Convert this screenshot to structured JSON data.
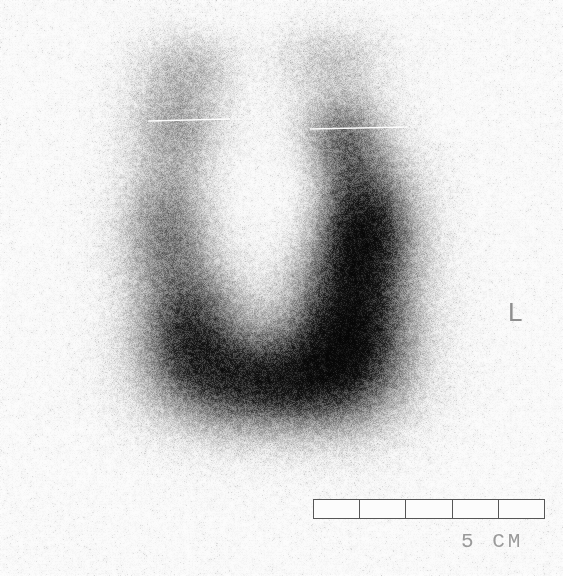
{
  "image": {
    "modality_label": "scintigraphy-scan",
    "width": 563,
    "height": 576,
    "background_color": "#fdfdfd"
  },
  "annotations": {
    "laterality_marker": {
      "label": "L",
      "color": "#8e8e8e",
      "x": 508,
      "y": 299
    },
    "scale_bar": {
      "label": "5 CM",
      "segments": 5,
      "total_length_cm": 5,
      "segment_length_cm": 1,
      "border_color": "#565656",
      "label_color": "#9a9a9a",
      "x": 313,
      "y": 499,
      "width": 232,
      "height": 20
    },
    "reference_lines": [
      {
        "name": "left-lobe-upper-marker",
        "x1": 148,
        "y1": 121,
        "x2": 230,
        "y2": 119
      },
      {
        "name": "right-lobe-upper-marker",
        "x1": 310,
        "y1": 129,
        "x2": 407,
        "y2": 127
      }
    ]
  },
  "chart_data": {
    "type": "heatmap",
    "title": "",
    "xlabel": "",
    "ylabel": "",
    "grid": false,
    "legend_position": "none",
    "colormap": "grayscale-inverted",
    "intensity_scale": {
      "min": 0,
      "max": 100,
      "unit": "relative counts"
    },
    "uptake_regions": [
      {
        "name": "central-photopenic-defect",
        "cx": 270,
        "cy": 190,
        "rx": 64,
        "ry": 82,
        "intensity": 4
      },
      {
        "name": "left-limb-superior",
        "cx": 178,
        "cy": 120,
        "rx": 52,
        "ry": 62,
        "intensity": 30
      },
      {
        "name": "left-limb-mid",
        "cx": 168,
        "cy": 230,
        "rx": 50,
        "ry": 72,
        "intensity": 44
      },
      {
        "name": "left-limb-inferior",
        "cx": 190,
        "cy": 330,
        "rx": 58,
        "ry": 70,
        "intensity": 68
      },
      {
        "name": "inferior-isthmus-band",
        "cx": 268,
        "cy": 382,
        "rx": 100,
        "ry": 54,
        "intensity": 82
      },
      {
        "name": "right-limb-inferior",
        "cx": 350,
        "cy": 330,
        "rx": 66,
        "ry": 84,
        "intensity": 93
      },
      {
        "name": "right-limb-mid",
        "cx": 362,
        "cy": 228,
        "rx": 56,
        "ry": 74,
        "intensity": 88
      },
      {
        "name": "right-limb-superior",
        "cx": 340,
        "cy": 140,
        "rx": 48,
        "ry": 56,
        "intensity": 46
      },
      {
        "name": "superior-scatter-left",
        "cx": 190,
        "cy": 62,
        "rx": 52,
        "ry": 34,
        "intensity": 14
      },
      {
        "name": "superior-scatter-right",
        "cx": 330,
        "cy": 58,
        "rx": 58,
        "ry": 36,
        "intensity": 16
      }
    ],
    "background_scatter": {
      "density": 0.035,
      "max_intensity": 22
    },
    "bounds": {
      "x_min": 100,
      "x_max": 430,
      "y_min": 18,
      "y_max": 470
    }
  }
}
